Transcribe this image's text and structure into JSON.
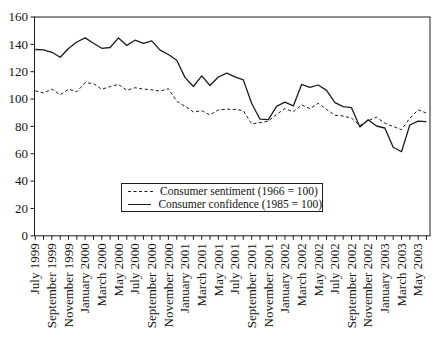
{
  "figure": {
    "background": "#fffffe",
    "axis_color": "#1c1c1c",
    "line_color": "#1c1c1c"
  },
  "legend": {
    "sentiment_label": "Consumer sentiment (1966 = 100)",
    "confidence_label": "Consumer confidence (1985 = 100)"
  },
  "chart_data": {
    "type": "line",
    "title": "",
    "xlabel": "",
    "ylabel": "",
    "grid": false,
    "legend_position": "inside lower center",
    "ylim": [
      0,
      160
    ],
    "yticks": [
      0,
      20,
      40,
      60,
      80,
      100,
      120,
      140,
      160
    ],
    "x_tick_labels": [
      "July 1999",
      "September 1999",
      "November 1999",
      "January 2000",
      "March 2000",
      "May 2000",
      "July 2000",
      "September 2000",
      "November 2000",
      "January 2001",
      "March 2001",
      "May 2001",
      "July 2001",
      "September 2001",
      "November 2001",
      "January 2002",
      "March 2002",
      "May 2002",
      "July 2002",
      "September 2002",
      "November 2002",
      "January 2003",
      "March 2003",
      "May 2003"
    ],
    "x_frequency": "monthly, July 1999 through June 2003, minor tick every month, label every second month",
    "series": [
      {
        "name": "Consumer sentiment (1966 = 100)",
        "style": "dashed",
        "values": [
          106.0,
          104.5,
          107.2,
          103.2,
          107.2,
          105.4,
          112.0,
          111.3,
          107.1,
          109.2,
          110.7,
          106.4,
          108.3,
          107.3,
          106.8,
          105.8,
          107.6,
          98.4,
          94.7,
          90.6,
          91.5,
          88.4,
          92.0,
          92.6,
          92.4,
          91.5,
          81.8,
          82.7,
          83.9,
          88.8,
          93.0,
          90.7,
          95.7,
          93.0,
          96.9,
          92.4,
          88.1,
          87.6,
          86.1,
          80.6,
          84.2,
          86.7,
          82.4,
          79.9,
          77.6,
          86.0,
          92.1,
          89.7
        ]
      },
      {
        "name": "Consumer confidence (1985 = 100)",
        "style": "solid",
        "values": [
          136.2,
          136.0,
          134.2,
          130.5,
          137.0,
          141.7,
          144.7,
          140.8,
          137.1,
          137.7,
          144.7,
          139.2,
          143.0,
          140.8,
          142.5,
          135.8,
          132.6,
          128.3,
          115.7,
          109.2,
          116.9,
          109.9,
          116.1,
          118.9,
          116.3,
          114.0,
          97.0,
          85.3,
          84.9,
          94.6,
          97.8,
          95.0,
          110.7,
          108.5,
          110.3,
          106.3,
          97.4,
          94.5,
          93.7,
          79.6,
          84.9,
          80.3,
          78.8,
          64.8,
          61.4,
          81.0,
          83.8,
          83.5
        ]
      }
    ]
  }
}
